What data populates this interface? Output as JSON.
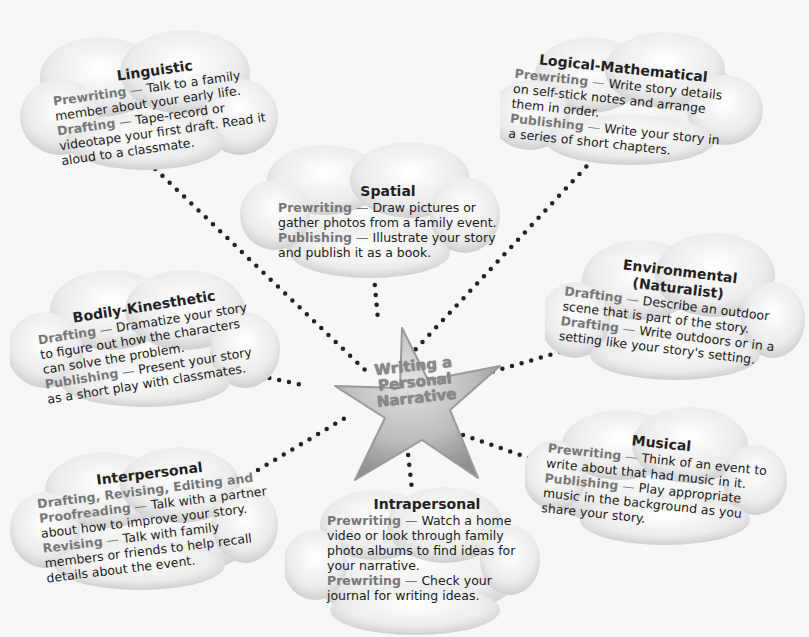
{
  "center": {
    "line1": "Writing a",
    "line2": "Personal",
    "line3": "Narrative"
  },
  "clouds": {
    "linguistic": {
      "title": "Linguistic",
      "entries": [
        {
          "label": "Prewriting",
          "text": "Talk to a family member about your early life."
        },
        {
          "label": "Drafting",
          "text": "Tape-record or videotape your first draft. Read it aloud to a classmate."
        }
      ]
    },
    "logical": {
      "title": "Logical-Mathematical",
      "entries": [
        {
          "label": "Prewriting",
          "text": "Write story details on self-stick notes and arrange them in order."
        },
        {
          "label": "Publishing",
          "text": "Write your story in a series of short chapters."
        }
      ]
    },
    "spatial": {
      "title": "Spatial",
      "entries": [
        {
          "label": "Prewriting",
          "text": "Draw pictures or gather photos from a family event."
        },
        {
          "label": "Publishing",
          "text": "Illustrate your story and publish it as a book."
        }
      ]
    },
    "bodily": {
      "title": "Bodily-Kinesthetic",
      "entries": [
        {
          "label": "Drafting",
          "text": "Dramatize your story to figure out how the characters can solve the problem."
        },
        {
          "label": "Publishing",
          "text": "Present your story as a short play with classmates."
        }
      ]
    },
    "environmental": {
      "title": "Environmental",
      "subtitle": "(Naturalist)",
      "entries": [
        {
          "label": "Drafting",
          "text": "Describe an outdoor scene that is part of the story."
        },
        {
          "label": "Drafting",
          "text": "Write outdoors or in a setting like your story's setting."
        }
      ]
    },
    "musical": {
      "title": "Musical",
      "entries": [
        {
          "label": "Prewriting",
          "text": "Think of an event to write about that had music in it."
        },
        {
          "label": "Publishing",
          "text": "Play appropriate music in the background as you share your story."
        }
      ]
    },
    "interpersonal": {
      "title": "Interpersonal",
      "entries": [
        {
          "label": "Drafting, Revising, Editing and Proofreading",
          "text": "Talk with a partner about how to improve your story."
        },
        {
          "label": "Revising",
          "text": "Talk with family members or friends to help recall details about the event."
        }
      ]
    },
    "intrapersonal": {
      "title": "Intrapersonal",
      "entries": [
        {
          "label": "Prewriting",
          "text": "Watch a home video or look through family photo albums to find ideas for your narrative."
        },
        {
          "label": "Prewriting",
          "text": "Check your journal for writing ideas."
        }
      ]
    }
  },
  "separator": "—",
  "colors": {
    "cloud_fill": "#e9e9e9",
    "label": "#777777",
    "text": "#1a1a1a",
    "dots": "#222222",
    "star": "#b5b5b5"
  }
}
